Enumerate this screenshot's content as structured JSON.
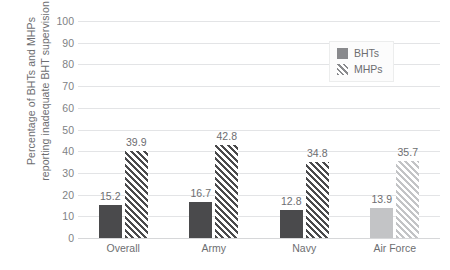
{
  "chart_data": {
    "type": "bar",
    "title": "",
    "xlabel": "",
    "ylabel": "Percentage of BHTs and MHPs reporting inadequate BHT supervision",
    "ylabel_line1": "Percentage of BHTs and MHPs",
    "ylabel_line2": "reporting inadequate BHT supervision",
    "categories": [
      "Overall",
      "Army",
      "Navy",
      "Air Force"
    ],
    "series": [
      {
        "name": "BHTs",
        "values": [
          15.2,
          16.7,
          12.8,
          13.9
        ],
        "style": "solid"
      },
      {
        "name": "MHPs",
        "values": [
          39.9,
          42.8,
          34.8,
          35.7
        ],
        "style": "hatched"
      }
    ],
    "ylim": [
      0,
      100
    ],
    "yticks": [
      0,
      10,
      20,
      30,
      40,
      50,
      60,
      70,
      80,
      90,
      100
    ],
    "ytick_labels": [
      "0",
      "10",
      "20",
      "30",
      "40",
      "50",
      "60",
      "70",
      "80",
      "90",
      "100"
    ],
    "grid": true,
    "grid_axis": "y",
    "legend_position": "top-right",
    "value_labels": true,
    "highlighted_category": "Air Force",
    "colors": {
      "bar_primary": "#4a4a4c",
      "bar_muted": "#c3c4c6",
      "legend_swatch": "#898a8d",
      "gridline": "#e3e4e6",
      "text": "#6d6e71",
      "tick_text": "#808285",
      "background": "#ffffff"
    }
  },
  "legend": {
    "items": [
      {
        "label": "BHTs",
        "style": "solid"
      },
      {
        "label": "MHPs",
        "style": "hatch"
      }
    ]
  }
}
